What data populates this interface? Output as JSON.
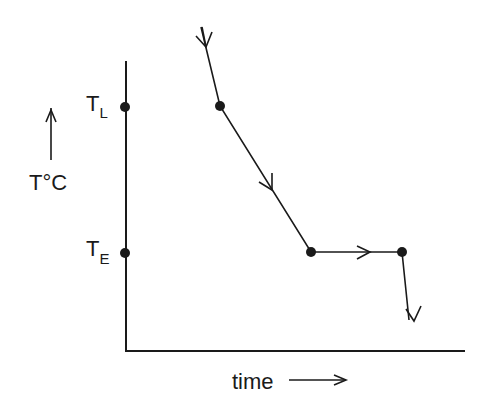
{
  "diagram": {
    "type": "cooling-curve",
    "y_axis_label": "T°C",
    "x_axis_label": "time",
    "y_ticks": [
      {
        "label": "T",
        "subscript": "L",
        "meaning": "liquidus temperature"
      },
      {
        "label": "T",
        "subscript": "E",
        "meaning": "eutectic temperature"
      }
    ],
    "curve_segments": [
      {
        "from": "start",
        "to": "T_L",
        "description": "cooling of liquid"
      },
      {
        "from": "T_L",
        "to": "T_E",
        "description": "cooling with crystallization (slower slope)"
      },
      {
        "from": "T_E",
        "to": "T_E end",
        "description": "eutectic arrest (horizontal)"
      },
      {
        "from": "T_E end",
        "to": "end",
        "description": "cooling of solid"
      }
    ],
    "colors": {
      "line": "#1a1a1a",
      "background": "#ffffff"
    }
  }
}
